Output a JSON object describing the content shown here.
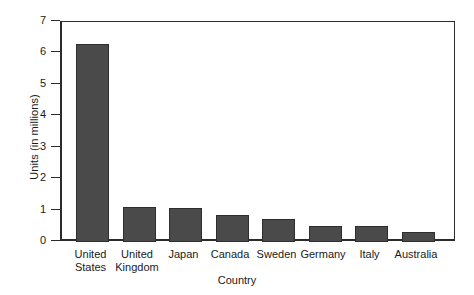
{
  "chart_data": {
    "type": "bar",
    "title": "",
    "xlabel": "Country",
    "ylabel": "Units (in millions)",
    "categories": [
      "United States",
      "United Kingdom",
      "Japan",
      "Canada",
      "Sweden",
      "Germany",
      "Italy",
      "Australia"
    ],
    "category_lines": [
      [
        "United",
        "States"
      ],
      [
        "United",
        "Kingdom"
      ],
      [
        "Japan",
        ""
      ],
      [
        "Canada",
        ""
      ],
      [
        "Sweden",
        ""
      ],
      [
        "Germany",
        ""
      ],
      [
        "Italy",
        ""
      ],
      [
        "Australia",
        ""
      ]
    ],
    "values": [
      6.3,
      1.1,
      1.07,
      0.87,
      0.73,
      0.5,
      0.5,
      0.32
    ],
    "ylim": [
      0,
      7
    ],
    "ytick_labels": [
      "7",
      "6",
      "5",
      "4",
      "3",
      "2",
      "1",
      "0"
    ],
    "ytick_values": [
      7,
      6,
      5,
      4,
      3,
      2,
      1,
      0
    ],
    "grid": false,
    "legend": false,
    "bar_color": "#4a4a4a",
    "bar_edge_color": "#2e2e2e",
    "axis_color": "#2b2b2b",
    "background_color": "#ffffff"
  }
}
